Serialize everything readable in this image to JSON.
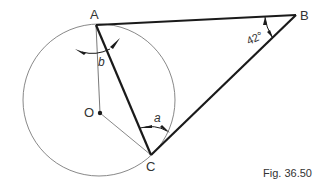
{
  "figure": {
    "caption": "Fig. 36.50",
    "points": {
      "A": {
        "label": "A",
        "x": 96,
        "y": 25
      },
      "B": {
        "label": "B",
        "x": 296,
        "y": 15
      },
      "C": {
        "label": "C",
        "x": 151,
        "y": 155
      },
      "O": {
        "label": "O",
        "x": 100,
        "y": 113
      }
    },
    "circle": {
      "center": "O",
      "cx": 100,
      "cy": 100,
      "r": 76
    },
    "angles": {
      "a": {
        "label": "a",
        "vertex": "C"
      },
      "b": {
        "label": "b",
        "vertex": "A"
      },
      "B": {
        "label": "42°",
        "vertex": "B"
      }
    },
    "colors": {
      "thick_line": "#1a1a1a",
      "thin_line": "#7a7a7a",
      "text": "#333333"
    }
  }
}
